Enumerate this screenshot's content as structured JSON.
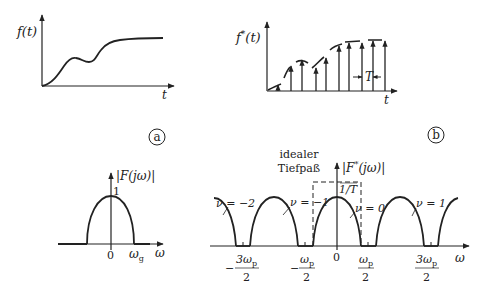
{
  "panel_a": {
    "time_plot": {
      "y_label": "f(t)",
      "x_label": "t"
    },
    "badge": "a",
    "spectrum": {
      "y_label": "|F(jω)|",
      "peak_label": "1",
      "x_ticks": [
        "0",
        "ω_g"
      ],
      "tick_zero": "0",
      "tick_wg_main": "ω",
      "tick_wg_sub": "g",
      "x_label": "ω"
    }
  },
  "panel_b": {
    "time_plot": {
      "y_label_main": "f",
      "y_label_sup": "*",
      "y_label_arg": "(t)",
      "x_label": "t",
      "period_label": "T"
    },
    "badge": "b",
    "spectrum": {
      "filter_label_line1": "idealer",
      "filter_label_line2": "Tiefpaß",
      "y_label": "|F*(jω)|",
      "y_label_main": "F",
      "y_label_sup": "*",
      "y_label_arg": "(jω)",
      "peak_label": "1/T",
      "nu_labels": [
        "ν = −2",
        "ν = −1",
        "ν = 0",
        "ν = 1"
      ],
      "x_label": "ω",
      "x_ticks": [
        {
          "sign": "−",
          "num": "3ω",
          "sub": "p",
          "den": "2"
        },
        {
          "sign": "−",
          "num": "ω",
          "sub": "p",
          "den": "2"
        },
        {
          "sign": "",
          "num": "0",
          "sub": "",
          "den": ""
        },
        {
          "sign": "",
          "num": "ω",
          "sub": "p",
          "den": "2"
        },
        {
          "sign": "",
          "num": "3ω",
          "sub": "p",
          "den": "2"
        }
      ]
    }
  }
}
